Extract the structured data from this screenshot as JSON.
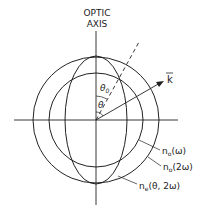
{
  "title_line1": "OPTIC",
  "title_line2": "AXIS",
  "labels": {
    "theta0": "θ",
    "theta0_sub": "0",
    "theta": "θ",
    "k": "k",
    "no_w": "n",
    "no_w_sub": "o",
    "no_w_arg": "(ω)",
    "no_2w": "n",
    "no_2w_sub": "o",
    "no_2w_arg": "(2ω)",
    "ne": "n",
    "ne_sub": "e",
    "ne_arg": "(θ, 2ω)"
  },
  "colors": {
    "stroke": "#222222",
    "background": "#ffffff"
  }
}
